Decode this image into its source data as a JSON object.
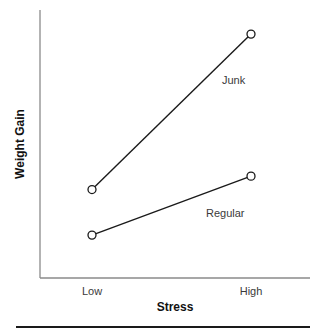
{
  "chart_data": {
    "type": "line",
    "title": "",
    "xlabel": "Stress",
    "ylabel": "Weight Gain",
    "categories": [
      "Low",
      "High"
    ],
    "series": [
      {
        "name": "Junk",
        "values": [
          3.3,
          9.1
        ]
      },
      {
        "name": "Regular",
        "values": [
          1.6,
          3.8
        ]
      }
    ],
    "ylim": [
      0,
      10
    ],
    "y_ticks_shown": false,
    "grid": false,
    "legend": "direct labels on lines",
    "marker": "open circle",
    "colors": {
      "line": "#1a1a1a",
      "axis": "#8a8a8a",
      "marker_fill": "#ffffff"
    }
  }
}
